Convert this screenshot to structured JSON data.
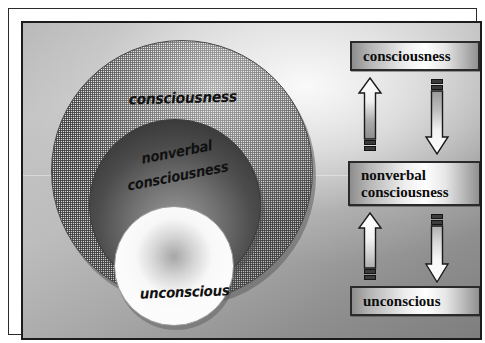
{
  "diagram": {
    "circles": {
      "outer_label": "consciousness",
      "middle_label_line1": "nonverbal",
      "middle_label_line2": "consciousness",
      "inner_label": "unconscious"
    },
    "flow": {
      "nodes": [
        {
          "id": "consciousness",
          "label": "consciousness"
        },
        {
          "id": "nonverbal-consciousness",
          "label_line1": "nonverbal",
          "label_line2": "consciousness"
        },
        {
          "id": "unconscious",
          "label": "unconscious"
        }
      ],
      "arrows": [
        {
          "id": "up-arrow-unconscious-to-nonverbal",
          "direction": "up",
          "icon": "arrow-up-icon"
        },
        {
          "id": "down-arrow-nonverbal-to-unconscious",
          "direction": "down",
          "icon": "arrow-down-icon"
        },
        {
          "id": "up-arrow-nonverbal-to-consciousness",
          "direction": "up",
          "icon": "arrow-up-icon"
        },
        {
          "id": "down-arrow-consciousness-to-nonverbal",
          "direction": "down",
          "icon": "arrow-down-icon"
        }
      ]
    },
    "colors": {
      "plate_light": "#c4c4c4",
      "plate_dark": "#7e7e7e",
      "frame": "#1c1c1c",
      "text": "#0c0c0c",
      "outer_circle": "#d4d4d4",
      "middle_circle": "#4c4c4c",
      "inner_circle": "#ffffff"
    }
  }
}
